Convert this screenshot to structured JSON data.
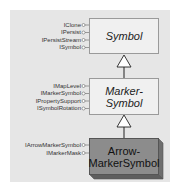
{
  "diagram": {
    "classes": [
      {
        "name": "Symbol",
        "lines": [
          "Symbol"
        ],
        "abstract": true,
        "interfaces": [
          "IClone",
          "IPersist",
          "IPersistStream",
          "ISymbol"
        ]
      },
      {
        "name": "MarkerSymbol",
        "lines": [
          "Marker-",
          "Symbol"
        ],
        "abstract": true,
        "interfaces": [
          "IMapLevel",
          "IMarkerSymbol",
          "IPropertySupport",
          "ISymbolRotation"
        ]
      },
      {
        "name": "ArrowMarkerSymbol",
        "lines": [
          "Arrow-",
          "MarkerSymbol"
        ],
        "abstract": false,
        "interfaces": [
          "IArrowMarkerSymbol",
          "IMarkerMask"
        ]
      }
    ],
    "relationships": [
      {
        "type": "inheritance",
        "from": "MarkerSymbol",
        "to": "Symbol"
      },
      {
        "type": "inheritance",
        "from": "ArrowMarkerSymbol",
        "to": "MarkerSymbol"
      }
    ],
    "colors": {
      "panel": "#e6e6e6",
      "abstract_fill": "#f0f0f0",
      "concrete_fill": "#8c8c8c",
      "concrete_side": "#6e6e6e",
      "line": "#333333"
    }
  }
}
